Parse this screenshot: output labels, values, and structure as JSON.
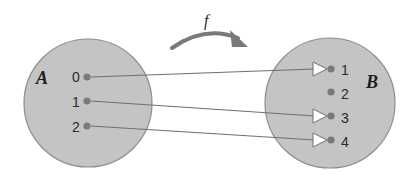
{
  "diagram": {
    "title": "",
    "function_label": "f",
    "domain_set": {
      "label": "A",
      "elements": [
        "0",
        "1",
        "2"
      ]
    },
    "codomain_set": {
      "label": "B",
      "elements": [
        "1",
        "2",
        "3",
        "4"
      ]
    },
    "mappings": [
      {
        "from": "0",
        "to": "1"
      },
      {
        "from": "1",
        "to": "3"
      },
      {
        "from": "2",
        "to": "4"
      }
    ],
    "colors": {
      "set_fill": "#c4c4c4",
      "set_stroke": "#8e8e8e",
      "dot": "#7a7a7a",
      "line": "#6f6f6f",
      "arrowhead_fill": "#ffffff"
    }
  }
}
